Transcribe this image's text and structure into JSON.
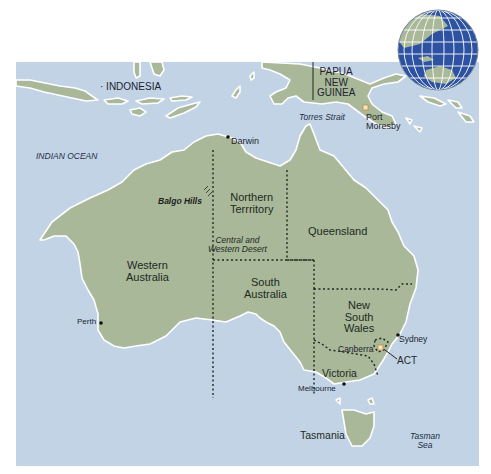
{
  "colors": {
    "ocean": "#c2d3e6",
    "land": "#a8b898",
    "coast": "#ffffff",
    "border": "#1e2a1e",
    "globe_ocean": "#2d52a2",
    "globe_grid": "#ffffff",
    "capital_marker": "#f6e6b8"
  },
  "countries": {
    "indonesia": "INDONESIA",
    "png": [
      "PAPUA",
      "NEW",
      "GUINEA"
    ]
  },
  "water": {
    "indian_ocean": "INDIAN OCEAN",
    "torres_strait": "Torres Strait",
    "tasman_sea": [
      "Tasman",
      "Sea"
    ]
  },
  "states": {
    "western_australia": [
      "Western",
      "Australia"
    ],
    "northern_territory": [
      "Northern",
      "Terrritory"
    ],
    "queensland": "Queensland",
    "south_australia": [
      "South",
      "Australia"
    ],
    "new_south_wales": [
      "New",
      "South",
      "Wales"
    ],
    "victoria": "Victoria",
    "act": "ACT",
    "tasmania": "Tasmania"
  },
  "cities": {
    "darwin": "Darwin",
    "perth": "Perth",
    "sydney": "Sydney",
    "canberra": "Canberra",
    "melbourne": "Melbourne",
    "port_moresby": [
      "Port",
      "Moresby"
    ]
  },
  "regions": {
    "balgo_hills": "Balgo Hills",
    "central_western_desert": [
      "Central and",
      "Western Desert"
    ]
  },
  "inset": {
    "icon": "globe-locator-icon"
  }
}
